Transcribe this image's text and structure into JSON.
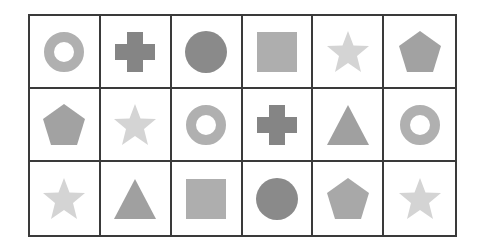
{
  "grid": {
    "rows": 3,
    "cols": 6,
    "border_color": "#3a3a3a",
    "cells": [
      [
        {
          "shape": "ring",
          "color": "#b0b0b0"
        },
        {
          "shape": "cross",
          "color": "#858585"
        },
        {
          "shape": "circle",
          "color": "#8a8a8a"
        },
        {
          "shape": "square",
          "color": "#aeaeae"
        },
        {
          "shape": "star",
          "color": "#d4d4d4"
        },
        {
          "shape": "pentagon",
          "color": "#a2a2a2"
        }
      ],
      [
        {
          "shape": "pentagon",
          "color": "#a2a2a2"
        },
        {
          "shape": "star",
          "color": "#d4d4d4"
        },
        {
          "shape": "ring",
          "color": "#b0b0b0"
        },
        {
          "shape": "cross",
          "color": "#858585"
        },
        {
          "shape": "triangle",
          "color": "#a0a0a0"
        },
        {
          "shape": "ring",
          "color": "#b0b0b0"
        }
      ],
      [
        {
          "shape": "star",
          "color": "#d4d4d4"
        },
        {
          "shape": "triangle",
          "color": "#a0a0a0"
        },
        {
          "shape": "square",
          "color": "#aeaeae"
        },
        {
          "shape": "circle",
          "color": "#8a8a8a"
        },
        {
          "shape": "pentagon",
          "color": "#a8a8a8"
        },
        {
          "shape": "star",
          "color": "#d4d4d4"
        }
      ]
    ]
  }
}
